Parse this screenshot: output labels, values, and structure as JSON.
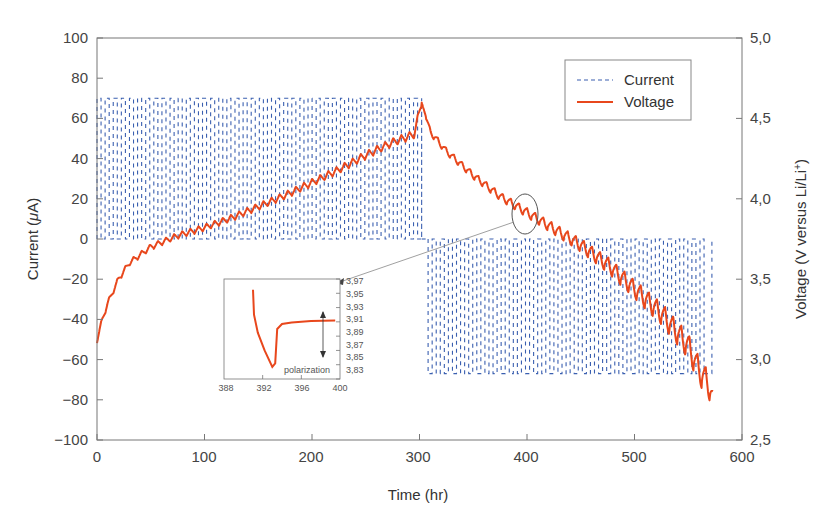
{
  "chart_data": {
    "type": "line",
    "title": "",
    "xlabel": "Time (hr)",
    "ylabel": "Current (μA)",
    "y2label": "Voltage (V versus Li/Li⁺)",
    "xlim": [
      0,
      600
    ],
    "ylim": [
      -100,
      100
    ],
    "y2lim": [
      2.5,
      5.0
    ],
    "x_ticks": [
      "0",
      "100",
      "200",
      "300",
      "400",
      "500",
      "600"
    ],
    "y_ticks": [
      "100",
      "80",
      "60",
      "40",
      "20",
      "0",
      "−20",
      "−40",
      "−60",
      "−80",
      "−100"
    ],
    "y2_ticks": [
      "5,0",
      "4,5",
      "4,0",
      "3,5",
      "3,0",
      "2,5"
    ],
    "grid": false,
    "legend_position": "upper right",
    "legend": [
      "Current",
      "Voltage"
    ],
    "series": [
      {
        "name": "Current",
        "style": "dashed",
        "color": "#3a5fb0",
        "axis": "left",
        "description": "Pulsed square-wave current: +70 μA charge pulses from 0 to ~302 hr, then −67 μA discharge pulses from ~308 to ~572 hr, returning to 0 μA between pulses",
        "x": [
          0,
          302,
          302,
          308,
          308,
          572,
          572
        ],
        "values": [
          70,
          70,
          0,
          0,
          -67,
          -67,
          0
        ]
      },
      {
        "name": "Voltage",
        "style": "solid",
        "color": "#e8471c",
        "axis": "right",
        "description": "GITT-style voltage profile with relaxation oscillations; rises during charge, falls during discharge",
        "x": [
          0,
          5,
          10,
          20,
          30,
          50,
          75,
          100,
          125,
          150,
          175,
          200,
          225,
          250,
          275,
          295,
          302,
          310,
          325,
          350,
          375,
          400,
          425,
          450,
          475,
          500,
          525,
          550,
          560,
          570,
          573
        ],
        "values": [
          3.12,
          3.25,
          3.35,
          3.5,
          3.6,
          3.7,
          3.77,
          3.82,
          3.88,
          3.95,
          4.02,
          4.1,
          4.18,
          4.27,
          4.35,
          4.4,
          4.6,
          4.42,
          4.3,
          4.15,
          4.02,
          3.92,
          3.82,
          3.72,
          3.6,
          3.45,
          3.3,
          3.1,
          2.95,
          2.85,
          2.75
        ]
      }
    ],
    "annotations": [
      {
        "type": "ellipse",
        "near_x": 400,
        "near_y_voltage": 3.92,
        "label": "zoomed region"
      },
      {
        "type": "arrow",
        "from": "ellipse",
        "to": "inset"
      }
    ],
    "inset": {
      "xlim": [
        388,
        400
      ],
      "ylim": [
        3.83,
        3.97
      ],
      "x_ticks": [
        "388",
        "392",
        "396",
        "400"
      ],
      "y_ticks": [
        "3,97",
        "3,95",
        "3,93",
        "3,91",
        "3,89",
        "3,87",
        "3,85",
        "3,83"
      ],
      "annotation": "polarization",
      "series": {
        "name": "Voltage",
        "x": [
          391.0,
          391.1,
          391.5,
          392.2,
          393.0,
          393.3,
          393.5,
          394.0,
          395.0,
          397.0,
          399.5
        ],
        "values": [
          3.955,
          3.92,
          3.895,
          3.87,
          3.847,
          3.852,
          3.9,
          3.907,
          3.909,
          3.911,
          3.912
        ]
      }
    }
  },
  "axes": {
    "x_title": "Time (hr)",
    "y_left_title_prefix": "Current (",
    "y_left_title_mu": "μ",
    "y_left_title_suffix": "A)",
    "y_right_title_prefix": "Voltage (V versus Li/Li",
    "y_right_title_sup": "+",
    "y_right_title_suffix": ")",
    "x_ticks": [
      "0",
      "100",
      "200",
      "300",
      "400",
      "500",
      "600"
    ],
    "y_left_ticks": [
      "100",
      "80",
      "60",
      "40",
      "20",
      "0",
      "−20",
      "−40",
      "−60",
      "−80",
      "−100"
    ],
    "y_right_ticks": [
      "5,0",
      "4,5",
      "4,0",
      "3,5",
      "3,0",
      "2,5"
    ]
  },
  "legend": {
    "current_label": "Current",
    "voltage_label": "Voltage"
  },
  "inset": {
    "x_ticks": [
      "388",
      "392",
      "396",
      "400"
    ],
    "y_ticks": [
      "3,97",
      "3,95",
      "3,93",
      "3,91",
      "3,89",
      "3,87",
      "3,85",
      "3,83"
    ],
    "annotation": "polarization"
  },
  "colors": {
    "current": "#3a5fb0",
    "voltage": "#e8471c",
    "axis": "#777777"
  }
}
